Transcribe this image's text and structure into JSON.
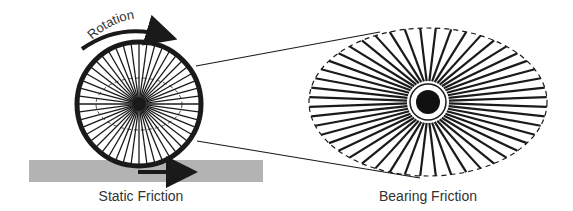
{
  "diagram": {
    "labels": {
      "rotation": "Rotation",
      "static_friction": "Static Friction",
      "bearing_friction": "Bearing Friction"
    },
    "colors": {
      "ink": "#1a1a1a",
      "ground": "#b3b3b3",
      "text": "#333333",
      "background": "#ffffff"
    },
    "wheel": {
      "cx": 139,
      "cy": 104,
      "r": 62,
      "rim_width": 5,
      "spoke_count": 48,
      "hub_r": 6,
      "inner_dashed_ellipse": {
        "rx": 43,
        "ry": 26
      }
    },
    "ground": {
      "x": 29,
      "y": 160,
      "width": 234,
      "height": 22
    },
    "rotation_arrow": {
      "icon": "curved-arrow-right-icon"
    },
    "friction_arrow": {
      "icon": "arrow-right-icon",
      "x1": 140,
      "x2": 192,
      "y": 172
    },
    "bearing_zoom": {
      "cx": 428,
      "cy": 102,
      "rx": 119,
      "ry": 74,
      "spoke_count": 48,
      "hub_r": 12,
      "ring_r": 18,
      "spoke_start_r": 21
    },
    "connector_lines": [
      {
        "x1": 196,
        "y1": 66,
        "x2": 380,
        "y2": 32
      },
      {
        "x1": 197,
        "y1": 141,
        "x2": 420,
        "y2": 178
      }
    ]
  }
}
